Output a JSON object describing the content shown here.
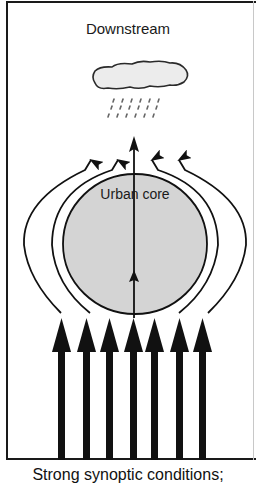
{
  "diagram": {
    "title": "Downstream",
    "core_label": "Urban core",
    "caption": "Strong synoptic conditions;",
    "elements": {
      "cloud": "rain-cloud-icon",
      "rain_drops": 3,
      "upstream_arrows": 7,
      "deflected_flow_lines": 4,
      "central_arrow": 1
    },
    "colors": {
      "line": "#111111",
      "core_fill": "#d4d4d4",
      "cloud_fill": "#ececec"
    }
  }
}
